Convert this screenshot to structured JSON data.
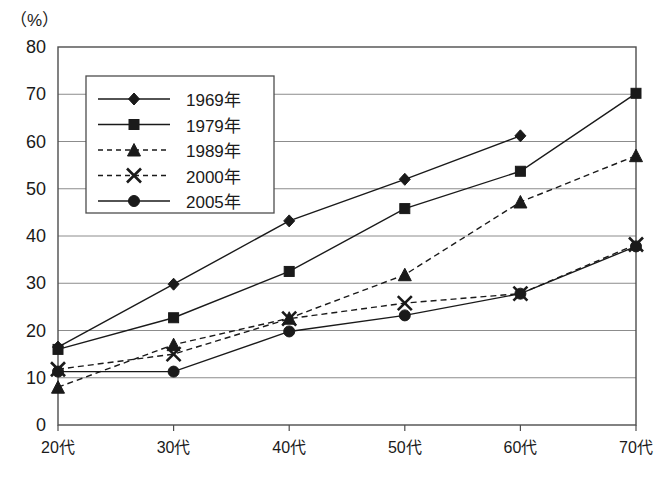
{
  "chart_data": {
    "type": "line",
    "title": "",
    "subtitle": "",
    "xlabel": "",
    "ylabel": "",
    "unit_label": "（%）",
    "categories": [
      "20代",
      "30代",
      "40代",
      "50代",
      "60代",
      "70代"
    ],
    "ylim": [
      0,
      80
    ],
    "yticks": [
      0,
      10,
      20,
      30,
      40,
      50,
      60,
      70,
      80
    ],
    "ytick_labels": [
      "0",
      "10",
      "20",
      "30",
      "40",
      "50",
      "60",
      "70",
      "80"
    ],
    "grid": "horizontal",
    "legend_position": "upper-left-inside",
    "series": [
      {
        "name": "1969年",
        "marker": "diamond",
        "line": "solid",
        "values": [
          16.5,
          29.8,
          43.2,
          52.0,
          61.2,
          null
        ]
      },
      {
        "name": "1979年",
        "marker": "square",
        "line": "solid",
        "values": [
          16.0,
          22.7,
          32.5,
          45.8,
          53.7,
          70.2
        ]
      },
      {
        "name": "1989年",
        "marker": "triangle",
        "line": "dashed",
        "values": [
          8.0,
          17.0,
          22.6,
          31.8,
          47.2,
          57.0
        ]
      },
      {
        "name": "2000年",
        "marker": "cross",
        "line": "dashed",
        "values": [
          11.8,
          15.0,
          22.5,
          25.8,
          27.8,
          38.2
        ]
      },
      {
        "name": "2005年",
        "marker": "circle",
        "line": "solid",
        "values": [
          11.3,
          11.3,
          19.8,
          23.2,
          27.8,
          37.8
        ]
      }
    ],
    "colors": {
      "line": "#1a1a1a",
      "grid": "#8c8c8c",
      "axis": "#4d4d4d",
      "background": "#ffffff"
    }
  },
  "legend": {
    "entries": [
      {
        "label": "1969年"
      },
      {
        "label": "1979年"
      },
      {
        "label": "1989年"
      },
      {
        "label": "2000年"
      },
      {
        "label": "2005年"
      }
    ]
  }
}
